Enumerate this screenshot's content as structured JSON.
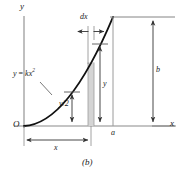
{
  "figure": {
    "caption": "(b)",
    "axes": {
      "y_label": "y",
      "x_label": "x",
      "origin_label": "O"
    },
    "curve": {
      "equation_lhs": "y",
      "equation_eq": "=",
      "equation_coef": "k",
      "equation_var": "x",
      "equation_exp": "2",
      "equation_full": "y = kx2"
    },
    "dimensions": {
      "strip_width": "dx",
      "strip_height": "y",
      "strip_half_height_num": "y",
      "strip_half_height_den": "2",
      "strip_half_height": "y/2",
      "base_width": "x",
      "total_width": "a",
      "total_height": "b"
    },
    "colors": {
      "curve": "#111111",
      "axis": "#8a8a8a",
      "dim_line": "#444444",
      "strip_fill": "#d4d4d4",
      "strip_edge": "#9a9a9a",
      "background": "#ffffff",
      "text": "#1a1a1a"
    },
    "geometry": {
      "origin_px": [
        24,
        126
      ],
      "curve_top_px": [
        113,
        17
      ],
      "strip_left_px": 88,
      "strip_right_px": 94,
      "x_axis_y_px": 126,
      "y_axis_x_px": 24
    }
  }
}
